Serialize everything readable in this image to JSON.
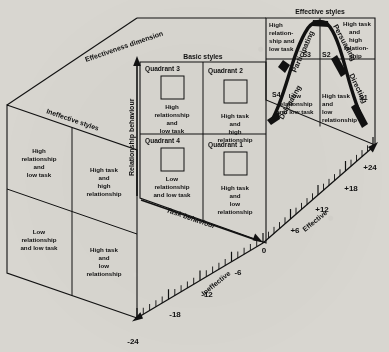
{
  "figure": {
    "background_color": "#d8d6d0",
    "line_color": "#111111"
  },
  "axes": {
    "vertical": {
      "label": "Relationship behaviour",
      "arrow": "up"
    },
    "horizontal": {
      "label": "Task behaviour",
      "arrow": "right"
    },
    "depth": {
      "label": "Effectiveness dimension",
      "positive_label": "Effective",
      "negative_label": "Ineffective",
      "ticks": [
        "-24",
        "-18",
        "-12",
        "-6",
        "0",
        "+6",
        "+12",
        "+18",
        "+24"
      ],
      "major_ticks": [
        "-24",
        "-18",
        "-12",
        "-6",
        "0",
        "+6",
        "+12",
        "+18",
        "+24"
      ],
      "minor_tick_count_per_interval": 5,
      "range": [
        -24,
        24
      ]
    }
  },
  "panels": {
    "ineffective": {
      "heading": "Ineffective styles",
      "cells": [
        {
          "position": "top-left",
          "text": "High\nrelationship\nand\nlow task"
        },
        {
          "position": "top-right",
          "text": "High task\nand\nhigh\nrelationship"
        },
        {
          "position": "bottom-left",
          "text": "Low\nrelationship\nand low task"
        },
        {
          "position": "bottom-right",
          "text": "High task\nand\nlow\nrelationship"
        }
      ]
    },
    "basic": {
      "heading": "Basic styles",
      "cells": [
        {
          "position": "top-left",
          "quadrant": "Quadrant 3",
          "text": "High\nrelationship\nand\nlow task"
        },
        {
          "position": "top-right",
          "quadrant": "Quadrant 2",
          "text": "High task\nand\nhigh\nrelationship"
        },
        {
          "position": "bottom-left",
          "quadrant": "Quadrant 4",
          "text": "Low\nrelationship\nand low task"
        },
        {
          "position": "bottom-right",
          "quadrant": "Quadrant 1",
          "text": "High task\nand\nlow\nrelationship"
        }
      ]
    },
    "effective": {
      "heading": "Effective styles",
      "cells": [
        {
          "position": "top-left",
          "style": "S3",
          "text": "High\nrelation-\nship and\nlow task"
        },
        {
          "position": "top-right",
          "style": "S2",
          "text": "High task\nand\nhigh\nrelation-\nship"
        },
        {
          "position": "bottom-left",
          "style": "S4",
          "text": "Low\nrelationship\nand low task"
        },
        {
          "position": "bottom-right",
          "style": "S1",
          "text": "High task\nand\nlow\nrelationship"
        }
      ],
      "style_labels": [
        "S4",
        "S3",
        "S2",
        "S1"
      ],
      "curve_labels": [
        "Delegating",
        "Participating",
        "Persuading",
        "Directing"
      ]
    }
  }
}
